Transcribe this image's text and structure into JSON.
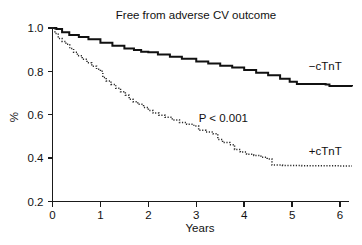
{
  "chart_data": {
    "type": "line",
    "title": "Free from adverse CV outcome",
    "xlabel": "Years",
    "ylabel": "%",
    "xlim": [
      0,
      6.3
    ],
    "ylim": [
      0.2,
      1.0
    ],
    "grid": false,
    "legend_position": "inline-right",
    "xticks": [
      "0",
      "1",
      "2",
      "3",
      "4",
      "5",
      "6"
    ],
    "xtick_values": [
      0,
      1,
      2,
      3,
      4,
      5,
      6
    ],
    "yticks": [
      "1.0",
      "0.8",
      "0.6",
      "0.4",
      "0.2"
    ],
    "ytick_values": [
      1.0,
      0.8,
      0.6,
      0.4,
      0.2
    ],
    "annotations": [
      {
        "text": "P < 0.001",
        "x": 3.05,
        "y": 0.565
      }
    ],
    "series": [
      {
        "name": "-cTnT",
        "label": "−cTnT",
        "style": "solid",
        "label_x": 5.35,
        "label_y": 0.805,
        "x": [
          0.0,
          0.08,
          0.2,
          0.35,
          0.55,
          0.75,
          1.0,
          1.25,
          1.5,
          1.7,
          1.85,
          2.0,
          2.2,
          2.45,
          2.7,
          3.0,
          3.25,
          3.5,
          3.75,
          4.0,
          4.25,
          4.5,
          4.75,
          4.95,
          5.1,
          5.7,
          5.78,
          6.25
        ],
        "y": [
          1.0,
          0.995,
          0.98,
          0.968,
          0.958,
          0.948,
          0.932,
          0.918,
          0.906,
          0.898,
          0.89,
          0.888,
          0.878,
          0.868,
          0.858,
          0.845,
          0.836,
          0.826,
          0.818,
          0.806,
          0.794,
          0.782,
          0.766,
          0.752,
          0.742,
          0.74,
          0.732,
          0.73
        ]
      },
      {
        "name": "+cTnT",
        "label": "+cTnT",
        "style": "dotted",
        "label_x": 5.35,
        "label_y": 0.415,
        "x": [
          0.0,
          0.05,
          0.12,
          0.2,
          0.28,
          0.36,
          0.44,
          0.52,
          0.62,
          0.72,
          0.82,
          0.92,
          1.0,
          1.05,
          1.12,
          1.22,
          1.32,
          1.42,
          1.52,
          1.6,
          1.68,
          1.78,
          1.9,
          2.0,
          2.1,
          2.22,
          2.35,
          2.5,
          2.65,
          2.8,
          2.95,
          3.05,
          3.2,
          3.35,
          3.45,
          3.55,
          3.7,
          3.8,
          3.92,
          4.05,
          4.2,
          4.35,
          4.48,
          4.58,
          4.8,
          5.2,
          5.6,
          6.0,
          6.25
        ],
        "y": [
          1.0,
          0.975,
          0.952,
          0.938,
          0.925,
          0.905,
          0.888,
          0.872,
          0.856,
          0.84,
          0.824,
          0.81,
          0.8,
          0.772,
          0.756,
          0.74,
          0.722,
          0.706,
          0.69,
          0.672,
          0.66,
          0.648,
          0.634,
          0.62,
          0.608,
          0.598,
          0.588,
          0.576,
          0.564,
          0.556,
          0.548,
          0.528,
          0.52,
          0.512,
          0.486,
          0.472,
          0.462,
          0.44,
          0.428,
          0.418,
          0.412,
          0.404,
          0.396,
          0.368,
          0.366,
          0.365,
          0.365,
          0.364,
          0.364
        ]
      }
    ]
  }
}
